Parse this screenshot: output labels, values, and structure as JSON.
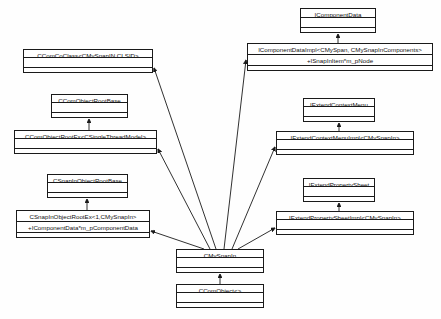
{
  "diagram": {
    "kind": "uml-class-diagram",
    "title": "",
    "background_color": "#fefefe",
    "line_color": "#1a1a1a",
    "box_fill": "#ffffff",
    "width": 441,
    "height": 319,
    "classes": [
      {
        "id": "icomponentdata",
        "name": "IComponentData",
        "attributes": [],
        "operations": [],
        "x": 300,
        "y": 8,
        "w": 76,
        "h": 25
      },
      {
        "id": "icomponentdataimpl",
        "name": "IComponentDataImpl<CMySpan, CMySnapInComponents>",
        "attributes": [
          "+ISnapInItem*m_pNode"
        ],
        "operations": [],
        "x": 247,
        "y": 43,
        "w": 186,
        "h": 28
      },
      {
        "id": "ccomcoclass",
        "name": "CComCoClass<CMySnapIN,CLSID>",
        "attributes": [],
        "operations": [],
        "x": 23,
        "y": 49,
        "w": 130,
        "h": 24
      },
      {
        "id": "ccomobjectrootbase",
        "name": "CComObjectRootBase",
        "attributes": [],
        "operations": [],
        "x": 51,
        "y": 94,
        "w": 77,
        "h": 24
      },
      {
        "id": "ccomobjectrootex",
        "name": "CComObjectRootEx<CSingleThreadModel>",
        "attributes": [],
        "operations": [],
        "x": 14,
        "y": 130,
        "w": 143,
        "h": 24
      },
      {
        "id": "iextendcontextmenu",
        "name": "IExtendContextMenu",
        "attributes": [],
        "operations": [],
        "x": 303,
        "y": 98,
        "w": 72,
        "h": 24
      },
      {
        "id": "iextendcontextmenuimpl",
        "name": "IExtendContextMenuImpl<CMySnapIn>",
        "attributes": [],
        "operations": [],
        "x": 276,
        "y": 131,
        "w": 138,
        "h": 24
      },
      {
        "id": "csnapinobjectrootbase",
        "name": "CSnapInObjectRootBase",
        "attributes": [],
        "operations": [],
        "x": 47,
        "y": 174,
        "w": 81,
        "h": 24
      },
      {
        "id": "csnapinobjectrootex",
        "name": "CSnapInObjectRootEx<1,CMySnapIn>",
        "attributes": [
          "+IComponentData*m_pComponentData"
        ],
        "operations": [],
        "x": 16,
        "y": 210,
        "w": 134,
        "h": 28
      },
      {
        "id": "iextendpropertysheet",
        "name": "IExtendPropertySheet",
        "attributes": [],
        "operations": [],
        "x": 303,
        "y": 178,
        "w": 72,
        "h": 24
      },
      {
        "id": "iextendpropertysheetimpl",
        "name": "IExtendPropertySheetImpl<CMySnapIn>",
        "attributes": [],
        "operations": [],
        "x": 276,
        "y": 211,
        "w": 138,
        "h": 24
      },
      {
        "id": "cmysnapin",
        "name": "CMySnapIn",
        "attributes": [],
        "operations": [],
        "x": 176,
        "y": 249,
        "w": 88,
        "h": 24
      },
      {
        "id": "ccomobject",
        "name": "CComObject<>",
        "attributes": [],
        "operations": [],
        "x": 176,
        "y": 284,
        "w": 88,
        "h": 24
      }
    ],
    "relations": [
      {
        "from": "icomponentdataimpl",
        "to": "icomponentdata",
        "type": "generalization"
      },
      {
        "from": "ccomobjectrootex",
        "to": "ccomobjectrootbase",
        "type": "generalization"
      },
      {
        "from": "iextendcontextmenuimpl",
        "to": "iextendcontextmenu",
        "type": "generalization"
      },
      {
        "from": "csnapinobjectrootex",
        "to": "csnapinobjectrootbase",
        "type": "generalization"
      },
      {
        "from": "iextendpropertysheetimpl",
        "to": "iextendpropertysheet",
        "type": "generalization"
      },
      {
        "from": "cmysnapin",
        "to": "ccomcoclass",
        "type": "generalization"
      },
      {
        "from": "cmysnapin",
        "to": "ccomobjectrootex",
        "type": "generalization"
      },
      {
        "from": "cmysnapin",
        "to": "csnapinobjectrootex",
        "type": "generalization"
      },
      {
        "from": "cmysnapin",
        "to": "icomponentdataimpl",
        "type": "generalization"
      },
      {
        "from": "cmysnapin",
        "to": "iextendcontextmenuimpl",
        "type": "generalization"
      },
      {
        "from": "cmysnapin",
        "to": "iextendpropertysheetimpl",
        "type": "generalization"
      },
      {
        "from": "ccomobject",
        "to": "cmysnapin",
        "type": "generalization"
      }
    ]
  }
}
